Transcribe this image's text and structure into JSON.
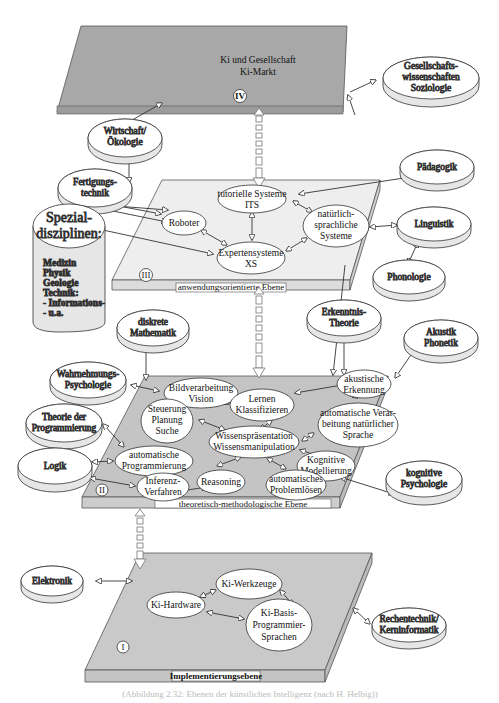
{
  "levels": {
    "iv": {
      "numeral": "IV",
      "title_line1": "Ki und Gesellschaft",
      "title_line2": "Ki-Markt"
    },
    "iii": {
      "numeral": "III",
      "label": "anwendungsorientierte Ebene"
    },
    "ii": {
      "numeral": "II",
      "label": "theoretisch-methodologische Ebene"
    },
    "i": {
      "numeral": "I",
      "label": "Implementierungsebene"
    }
  },
  "external": {
    "gesellschaft": [
      "Gesellschafts-",
      "wissenschaften",
      "Soziologie"
    ],
    "wirtschaft": [
      "Wirtschaft/",
      "Ökologie"
    ],
    "fertigung": [
      "Fertigungs-",
      "technik"
    ],
    "paedagogik": [
      "Pädagogik"
    ],
    "linguistik": [
      "Linguistik"
    ],
    "phonologie": [
      "Phonologie"
    ],
    "spezial": {
      "title": [
        "Spezial-",
        "disziplinen:"
      ],
      "items": [
        "Medizin",
        "Physik",
        "Geologie",
        "Technik:",
        "- Informations-",
        "- u.a."
      ]
    },
    "diskrete": [
      "diskrete",
      "Mathematik"
    ],
    "erkenntnis": [
      "Erkenntnis-",
      "Theorie"
    ],
    "akustik": [
      "Akustik",
      "Phonetik"
    ],
    "wahrnehmung": [
      "Wahrnehmungs-",
      "Psychologie"
    ],
    "theorie_prog": [
      "Theorie der",
      "Programmierung"
    ],
    "logik": [
      "Logik"
    ],
    "kog_psych": [
      "kognitive",
      "Psychologie"
    ],
    "elektronik": [
      "Elektronik"
    ],
    "rechentechnik": [
      "Rechentechnik/",
      "Kerninformatik"
    ]
  },
  "level3_nodes": {
    "tutoriell": [
      "tutorielle Systeme",
      "ITS"
    ],
    "roboter": [
      "Roboter"
    ],
    "natuerlich": [
      "natürlich-",
      "sprachliche",
      "Systeme"
    ],
    "experten": [
      "Expertensysteme",
      "XS"
    ]
  },
  "level2_nodes": {
    "bild": [
      "Bildverarbeitung",
      "Vision"
    ],
    "lernen": [
      "Lernen",
      "Klassifizieren"
    ],
    "akustische": [
      "akustische",
      "Erkennung"
    ],
    "steuerung": [
      "Steuerung",
      "Planung",
      "Suche"
    ],
    "autosprache": [
      "automatische Verar-",
      "beitung natürlicher",
      "Sprache"
    ],
    "wissen": [
      "Wissenspräsentation",
      "Wissensmanipulation"
    ],
    "autoprog": [
      "automatische",
      "Programmierung"
    ],
    "kognitiv": [
      "Kognitive",
      "Modellierung"
    ],
    "inferenz": [
      "Inferenz-",
      "Verfahren"
    ],
    "reasoning": [
      "Reasoning"
    ],
    "problem": [
      "automatisches",
      "Problemlösen"
    ]
  },
  "level1_nodes": {
    "werkzeuge": [
      "Ki-Werkzeuge"
    ],
    "hardware": [
      "Ki-Hardware"
    ],
    "basis": [
      "Ki-Basis-",
      "Programmier-",
      "Sprachen"
    ]
  },
  "caption": "(Abbildung 2.32: Ebenen der künstlichen Intelligenz (nach H. Helbig))",
  "colors": {
    "plane": "#c9c9c9",
    "plane_top": "#a9a9a9",
    "plane_edge": "#b5b5b5",
    "ellipse_fill": "#ffffff",
    "ellipse_side": "#e8e8e8",
    "stroke": "#444444"
  }
}
